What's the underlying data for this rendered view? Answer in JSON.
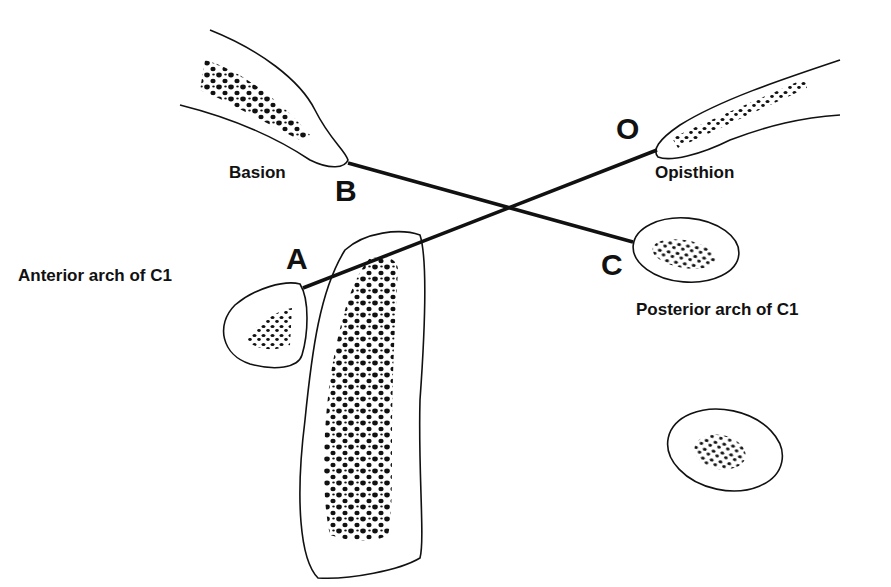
{
  "diagram": {
    "title": "",
    "points": {
      "B": {
        "letter": "B",
        "name": "Basion"
      },
      "O": {
        "letter": "O",
        "name": "Opisthion"
      },
      "A": {
        "letter": "A",
        "name": "Anterior arch of C1"
      },
      "C": {
        "letter": "C",
        "name": "Posterior arch of C1"
      }
    },
    "lines": [
      {
        "from": "B",
        "to": "C",
        "label": "BC line"
      },
      {
        "from": "O",
        "to": "A",
        "label": "OA line"
      }
    ],
    "line_color": "#111111",
    "outline_color": "#111111",
    "background": "#ffffff"
  }
}
